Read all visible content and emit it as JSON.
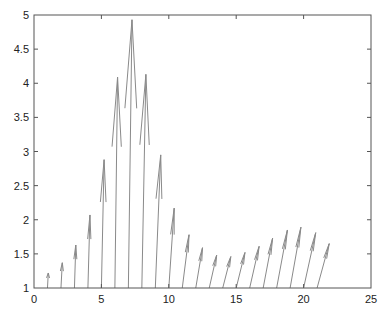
{
  "chart_data": {
    "type": "quiver",
    "title": "",
    "xlabel": "",
    "ylabel": "",
    "xlim": [
      0,
      25
    ],
    "ylim": [
      1,
      5
    ],
    "grid": false,
    "legend": null,
    "xticks": [
      0,
      5,
      10,
      15,
      20,
      25
    ],
    "yticks": [
      1,
      1.5,
      2,
      2.5,
      3,
      3.5,
      4,
      4.5,
      5
    ],
    "xtick_labels": [
      "0",
      "5",
      "10",
      "15",
      "20",
      "25"
    ],
    "ytick_labels": [
      "1",
      "1.5",
      "2",
      "2.5",
      "3",
      "3.5",
      "4",
      "4.5",
      "5"
    ],
    "arrow_color": "#8a8a8a",
    "axis_color": "#555555",
    "arrows": [
      {
        "x0": 1,
        "y0": 1,
        "x1": 1.06,
        "y1": 1.22
      },
      {
        "x0": 2,
        "y0": 1,
        "x1": 2.1,
        "y1": 1.37
      },
      {
        "x0": 3,
        "y0": 1,
        "x1": 3.1,
        "y1": 1.63
      },
      {
        "x0": 4,
        "y0": 1,
        "x1": 4.15,
        "y1": 2.07
      },
      {
        "x0": 5,
        "y0": 1,
        "x1": 5.2,
        "y1": 2.88
      },
      {
        "x0": 6,
        "y0": 1,
        "x1": 6.2,
        "y1": 4.09
      },
      {
        "x0": 7,
        "y0": 1,
        "x1": 7.27,
        "y1": 4.93
      },
      {
        "x0": 8,
        "y0": 1,
        "x1": 8.3,
        "y1": 4.13
      },
      {
        "x0": 9,
        "y0": 1,
        "x1": 9.4,
        "y1": 2.95
      },
      {
        "x0": 10,
        "y0": 1,
        "x1": 10.4,
        "y1": 2.17
      },
      {
        "x0": 11,
        "y0": 1,
        "x1": 11.5,
        "y1": 1.78
      },
      {
        "x0": 12,
        "y0": 1,
        "x1": 12.5,
        "y1": 1.59
      },
      {
        "x0": 13,
        "y0": 1,
        "x1": 13.55,
        "y1": 1.48
      },
      {
        "x0": 14,
        "y0": 1,
        "x1": 14.6,
        "y1": 1.46
      },
      {
        "x0": 15,
        "y0": 1,
        "x1": 15.65,
        "y1": 1.52
      },
      {
        "x0": 16,
        "y0": 1,
        "x1": 16.7,
        "y1": 1.61
      },
      {
        "x0": 17,
        "y0": 1,
        "x1": 17.7,
        "y1": 1.73
      },
      {
        "x0": 18,
        "y0": 1,
        "x1": 18.8,
        "y1": 1.85
      },
      {
        "x0": 19,
        "y0": 1,
        "x1": 19.8,
        "y1": 1.89
      },
      {
        "x0": 20,
        "y0": 1,
        "x1": 20.9,
        "y1": 1.81
      },
      {
        "x0": 21,
        "y0": 1,
        "x1": 21.9,
        "y1": 1.65
      }
    ]
  }
}
